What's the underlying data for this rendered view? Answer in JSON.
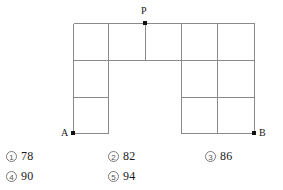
{
  "figure": {
    "stroke_color": "#8a8a8a",
    "outline_color": "#6e6e6e",
    "dot_color": "#111111",
    "vertices": [
      {
        "id": "P",
        "label": "P",
        "x": 145,
        "y": 23
      },
      {
        "id": "A",
        "label": "A",
        "x": 73,
        "y": 133
      },
      {
        "id": "B",
        "label": "B",
        "x": 254,
        "y": 133
      }
    ],
    "grid": {
      "x_positions": [
        73,
        108,
        145,
        181,
        217,
        254
      ],
      "y_positions": [
        23,
        60,
        97,
        133
      ],
      "horizontal_segments": [
        {
          "y": 23,
          "x1": 73,
          "x2": 254
        },
        {
          "y": 60,
          "x1": 73,
          "x2": 254
        },
        {
          "y": 97,
          "x1": 73,
          "x2": 108
        },
        {
          "y": 97,
          "x1": 181,
          "x2": 254
        },
        {
          "y": 133,
          "x1": 73,
          "x2": 108
        },
        {
          "y": 133,
          "x1": 181,
          "x2": 254
        }
      ],
      "vertical_segments": [
        {
          "x": 73,
          "y1": 23,
          "y2": 133
        },
        {
          "x": 108,
          "y1": 23,
          "y2": 133
        },
        {
          "x": 145,
          "y1": 23,
          "y2": 60
        },
        {
          "x": 181,
          "y1": 23,
          "y2": 133
        },
        {
          "x": 217,
          "y1": 23,
          "y2": 133
        },
        {
          "x": 254,
          "y1": 23,
          "y2": 133
        }
      ]
    }
  },
  "options": [
    {
      "marker": "①",
      "number": "1",
      "value": "78",
      "row": 1,
      "col": 1
    },
    {
      "marker": "②",
      "number": "2",
      "value": "82",
      "row": 1,
      "col": 2
    },
    {
      "marker": "③",
      "number": "3",
      "value": "86",
      "row": 1,
      "col": 3
    },
    {
      "marker": "④",
      "number": "4",
      "value": "90",
      "row": 2,
      "col": 1
    },
    {
      "marker": "⑤",
      "number": "5",
      "value": "94",
      "row": 2,
      "col": 2
    }
  ]
}
